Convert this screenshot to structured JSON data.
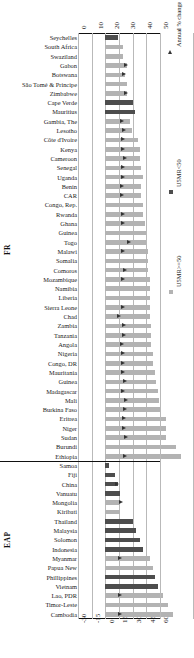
{
  "chart_data": {
    "type": "bar",
    "title": "",
    "xlabel_top": "",
    "xlabel_bottom": "",
    "ylabel": "",
    "grid": true,
    "legend_position": "right-rotated",
    "axis_top": {
      "ticks": [
        "0",
        "10",
        "20",
        "30",
        "40",
        "50"
      ],
      "min": 0,
      "max": 50
    },
    "axis_bottom": {
      "ticks": [
        "-30",
        "-15",
        "0",
        "15",
        "30",
        "45",
        "60"
      ],
      "min": -30,
      "max": 60
    },
    "legend": [
      {
        "key": "u5mr_high",
        "label": "U5MR>=50",
        "marker": "square",
        "color": "#b3b3b3"
      },
      {
        "key": "u5mr_low",
        "label": "U5MR<50",
        "marker": "square",
        "color": "#4d4d4d"
      },
      {
        "key": "change",
        "label": "Annual % change (1990–2002)",
        "marker": "triangle",
        "color": "#333333"
      }
    ],
    "sections": [
      {
        "id": "fr",
        "label": "FR",
        "rows": [
          {
            "category": "Seychelles",
            "bar": 8,
            "series": "u5mr_low",
            "change": null
          },
          {
            "category": "South Africa",
            "bar": 11,
            "series": "u5mr_high",
            "change": null
          },
          {
            "category": "Swaziland",
            "bar": 11,
            "series": "u5mr_high",
            "change": null
          },
          {
            "category": "Gabon",
            "bar": 13,
            "series": "u5mr_high",
            "change": 23.0
          },
          {
            "category": "Botswana",
            "bar": 12,
            "series": "u5mr_high",
            "change": 21.0
          },
          {
            "category": "São Tomé & Principe",
            "bar": 13,
            "series": "u5mr_high",
            "change": null
          },
          {
            "category": "Zimbabwe",
            "bar": 13,
            "series": "u5mr_high",
            "change": 23.0
          },
          {
            "category": "Cape Verde",
            "bar": 17,
            "series": "u5mr_low",
            "change": null
          },
          {
            "category": "Mauritius",
            "bar": 18,
            "series": "u5mr_low",
            "change": null
          },
          {
            "category": "Gambia, The",
            "bar": 15,
            "series": "u5mr_high",
            "change": 18.0
          },
          {
            "category": "Lesotho",
            "bar": 16,
            "series": "u5mr_high",
            "change": 20.0
          },
          {
            "category": "Côte d'Ivoire",
            "bar": 20,
            "series": "u5mr_high",
            "change": 19.5
          },
          {
            "category": "Kenya",
            "bar": 21,
            "series": "u5mr_high",
            "change": 19.5
          },
          {
            "category": "Cameroon",
            "bar": 21,
            "series": "u5mr_high",
            "change": 22.0
          },
          {
            "category": "Senegal",
            "bar": 22,
            "series": "u5mr_high",
            "change": 19.5
          },
          {
            "category": "Uganda",
            "bar": 23,
            "series": "u5mr_high",
            "change": 19.5
          },
          {
            "category": "Benin",
            "bar": 22,
            "series": "u5mr_high",
            "change": 18.0
          },
          {
            "category": "CAR",
            "bar": 22,
            "series": "u5mr_high",
            "change": 18.5
          },
          {
            "category": "Congo, Rep.",
            "bar": 23,
            "series": "u5mr_high",
            "change": null
          },
          {
            "category": "Rwanda",
            "bar": 23,
            "series": "u5mr_high",
            "change": 19.5
          },
          {
            "category": "Ghana",
            "bar": 24,
            "series": "u5mr_high",
            "change": 19.5
          },
          {
            "category": "Guinea",
            "bar": 25,
            "series": "u5mr_high",
            "change": null
          },
          {
            "category": "Togo",
            "bar": 25,
            "series": "u5mr_high",
            "change": 26.0
          },
          {
            "category": "Malawi",
            "bar": 26,
            "series": "u5mr_high",
            "change": 19.0
          },
          {
            "category": "Somalia",
            "bar": 26,
            "series": "u5mr_high",
            "change": null
          },
          {
            "category": "Comoros",
            "bar": 26,
            "series": "u5mr_high",
            "change": 21.5
          },
          {
            "category": "Mozambique",
            "bar": 27,
            "series": "u5mr_high",
            "change": 19.0
          },
          {
            "category": "Namibia",
            "bar": 27,
            "series": "u5mr_high",
            "change": null
          },
          {
            "category": "Liberia",
            "bar": 27,
            "series": "u5mr_high",
            "change": null
          },
          {
            "category": "Sierra Leone",
            "bar": 27,
            "series": "u5mr_high",
            "change": 19.5
          },
          {
            "category": "Chad",
            "bar": 27,
            "series": "u5mr_high",
            "change": 15.5
          },
          {
            "category": "Zambia",
            "bar": 28,
            "series": "u5mr_high",
            "change": 21.0
          },
          {
            "category": "Tanzania",
            "bar": 28,
            "series": "u5mr_high",
            "change": 20.5
          },
          {
            "category": "Angola",
            "bar": 28,
            "series": "u5mr_high",
            "change": 18.5
          },
          {
            "category": "Nigeria",
            "bar": 29,
            "series": "u5mr_high",
            "change": 19.0
          },
          {
            "category": "Congo, DR",
            "bar": 29,
            "series": "u5mr_high",
            "change": 19.0
          },
          {
            "category": "Mauritania",
            "bar": 30,
            "series": "u5mr_high",
            "change": 19.0
          },
          {
            "category": "Guinea",
            "bar": 31,
            "series": "u5mr_high",
            "change": 22.0
          },
          {
            "category": "Madagascar",
            "bar": 32,
            "series": "u5mr_high",
            "change": 19.5
          },
          {
            "category": "Mali",
            "bar": 33,
            "series": "u5mr_high",
            "change": 22.5
          },
          {
            "category": "Burkina Faso",
            "bar": 34,
            "series": "u5mr_high",
            "change": 21.5
          },
          {
            "category": "Eritrea",
            "bar": 37,
            "series": "u5mr_high",
            "change": 21.0
          },
          {
            "category": "Niger",
            "bar": 37,
            "series": "u5mr_high",
            "change": 21.0
          },
          {
            "category": "Sudan",
            "bar": 37,
            "series": "u5mr_high",
            "change": 22.5
          },
          {
            "category": "Burundi",
            "bar": 43,
            "series": "u5mr_high",
            "change": null
          },
          {
            "category": "Ethiopia",
            "bar": 46,
            "series": "u5mr_high",
            "change": 21.5
          }
        ]
      },
      {
        "id": "eap",
        "label": "EAP",
        "rows": [
          {
            "category": "Samoa",
            "bar": 2,
            "series": "u5mr_low",
            "change": null
          },
          {
            "category": "Fiji",
            "bar": 6,
            "series": "u5mr_low",
            "change": null
          },
          {
            "category": "China",
            "bar": 8,
            "series": "u5mr_low",
            "change": 13.0
          },
          {
            "category": "Vanuatu",
            "bar": 9,
            "series": "u5mr_low",
            "change": null
          },
          {
            "category": "Mongolia",
            "bar": 9,
            "series": "u5mr_high",
            "change": 17.0
          },
          {
            "category": "Kiribati",
            "bar": 9,
            "series": "u5mr_high",
            "change": null
          },
          {
            "category": "Thailand",
            "bar": 17,
            "series": "u5mr_low",
            "change": null
          },
          {
            "category": "Malaysia",
            "bar": 19,
            "series": "u5mr_low",
            "change": null
          },
          {
            "category": "Solomon",
            "bar": 21,
            "series": "u5mr_low",
            "change": null
          },
          {
            "category": "Indonesia",
            "bar": 23,
            "series": "u5mr_low",
            "change": null
          },
          {
            "category": "Myanmar",
            "bar": 27,
            "series": "u5mr_high",
            "change": 16.5
          },
          {
            "category": "Papua New",
            "bar": 29,
            "series": "u5mr_high",
            "change": null
          },
          {
            "category": "Phillippines",
            "bar": 30,
            "series": "u5mr_low",
            "change": null
          },
          {
            "category": "Vietnam",
            "bar": 32,
            "series": "u5mr_low",
            "change": null
          },
          {
            "category": "Lao, PDR",
            "bar": 35,
            "series": "u5mr_high",
            "change": 16.0
          },
          {
            "category": "Timor-Leste",
            "bar": 38,
            "series": "u5mr_high",
            "change": null
          },
          {
            "category": "Cambodia",
            "bar": 41,
            "series": "u5mr_high",
            "change": 16.5
          }
        ]
      }
    ]
  }
}
